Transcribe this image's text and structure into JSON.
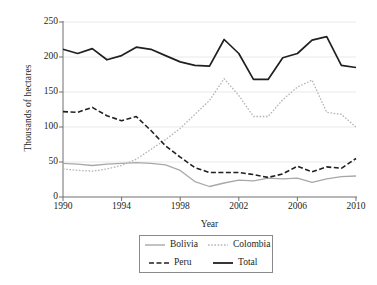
{
  "chart_data": {
    "type": "line",
    "title": "",
    "xlabel": "Year",
    "ylabel": "Thousands of hectares",
    "xlim": [
      1990,
      2010
    ],
    "ylim": [
      0,
      250
    ],
    "yticks": [
      0,
      50,
      100,
      150,
      200,
      250
    ],
    "xticks": [
      1990,
      1994,
      1998,
      2002,
      2006,
      2010
    ],
    "grid": true,
    "legend_position": "bottom-center",
    "x": [
      1990,
      1991,
      1992,
      1993,
      1994,
      1995,
      1996,
      1997,
      1998,
      1999,
      2000,
      2001,
      2002,
      2003,
      2004,
      2005,
      2006,
      2007,
      2008,
      2009,
      2010
    ],
    "series": [
      {
        "name": "Bolivia",
        "color": "#a8a8a8",
        "style": "solid",
        "values": [
          48,
          47,
          45,
          47,
          48,
          49,
          48,
          46,
          38,
          22,
          15,
          20,
          24,
          23,
          27,
          26,
          27,
          21,
          26,
          29,
          30
        ]
      },
      {
        "name": "Colombia",
        "color": "#b5b5b5",
        "style": "dotted",
        "values": [
          40,
          38,
          37,
          40,
          45,
          54,
          68,
          82,
          98,
          118,
          138,
          169,
          145,
          115,
          115,
          139,
          157,
          167,
          121,
          118,
          100
        ]
      },
      {
        "name": "Peru",
        "color": "#231f20",
        "style": "dashed",
        "values": [
          122,
          121,
          128,
          116,
          109,
          115,
          95,
          73,
          57,
          42,
          35,
          35,
          35,
          32,
          28,
          33,
          44,
          36,
          43,
          41,
          55
        ]
      },
      {
        "name": "Total",
        "color": "#231f20",
        "style": "solid",
        "values": [
          211,
          205,
          212,
          196,
          202,
          214,
          211,
          202,
          193,
          188,
          187,
          225,
          205,
          168,
          168,
          199,
          205,
          224,
          229,
          188,
          185
        ]
      }
    ]
  },
  "axes": {
    "y_title": "Thousands of hectares",
    "x_title": "Year",
    "y_tick_labels": [
      "0",
      "50",
      "100",
      "150",
      "200",
      "250"
    ],
    "x_tick_labels": [
      "1990",
      "1994",
      "1998",
      "2002",
      "2006",
      "2010"
    ]
  },
  "legend": {
    "entries": [
      {
        "label": "Bolivia",
        "color": "#a8a8a8",
        "style": "solid"
      },
      {
        "label": "Colombia",
        "color": "#b5b5b5",
        "style": "dotted"
      },
      {
        "label": "Peru",
        "color": "#231f20",
        "style": "dashed"
      },
      {
        "label": "Total",
        "color": "#231f20",
        "style": "solid"
      }
    ]
  },
  "colors": {
    "axis": "#6f6f6f",
    "grid": "#e9e9e9",
    "text": "#231f20",
    "background": "#ffffff"
  }
}
